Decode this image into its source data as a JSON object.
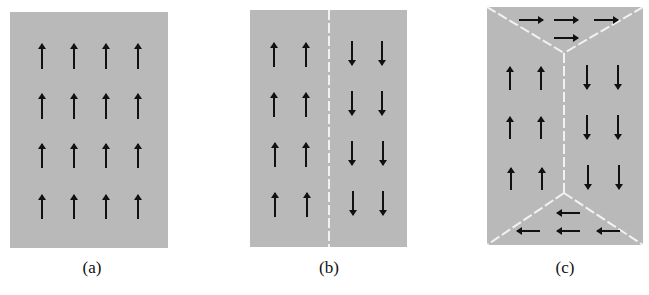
{
  "figure": {
    "colors": {
      "domain_fill": "#b9b9b9",
      "arrow": "#111111",
      "wall": "#f2f2f2",
      "background": "#ffffff"
    },
    "panels": [
      {
        "id": "a",
        "label": "(a)",
        "domains": [
          {
            "direction": "up",
            "rows": 4,
            "cols": 4
          }
        ],
        "walls": 0
      },
      {
        "id": "b",
        "label": "(b)",
        "domains": [
          {
            "direction": "up",
            "rows": 4,
            "cols": 2
          },
          {
            "direction": "down",
            "rows": 4,
            "cols": 2
          }
        ],
        "walls": 1
      },
      {
        "id": "c",
        "label": "(c)",
        "domains": [
          {
            "direction": "right",
            "count": 4,
            "position": "top"
          },
          {
            "direction": "up",
            "rows": 3,
            "cols": 2,
            "position": "left"
          },
          {
            "direction": "down",
            "rows": 3,
            "cols": 2,
            "position": "right"
          },
          {
            "direction": "left",
            "count": 4,
            "position": "bottom"
          }
        ],
        "walls": 5
      }
    ]
  }
}
